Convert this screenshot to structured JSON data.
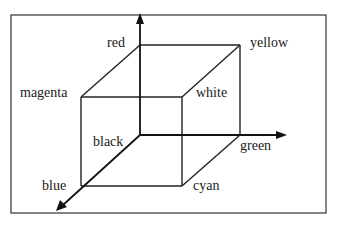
{
  "diagram": {
    "type": "3d-axes-cube",
    "frame": {
      "x": 11,
      "y": 15,
      "width": 315,
      "height": 198,
      "stroke": "#333333"
    },
    "origin": {
      "x": 140,
      "y": 135
    },
    "axes": [
      {
        "id": "red-axis",
        "direction": "up",
        "from": [
          140,
          135
        ],
        "to": [
          140,
          14
        ]
      },
      {
        "id": "green-axis",
        "direction": "right",
        "from": [
          140,
          135
        ],
        "to": [
          286,
          135
        ]
      },
      {
        "id": "blue-axis",
        "direction": "down-left",
        "from": [
          140,
          135
        ],
        "to": [
          57,
          210
        ]
      }
    ],
    "vertices": {
      "black": {
        "x": 140,
        "y": 135
      },
      "red": {
        "x": 140,
        "y": 45
      },
      "yellow": {
        "x": 240,
        "y": 45
      },
      "green": {
        "x": 240,
        "y": 135
      },
      "magenta": {
        "x": 81,
        "y": 97
      },
      "white": {
        "x": 182,
        "y": 97
      },
      "blue": {
        "x": 81,
        "y": 186
      },
      "cyan": {
        "x": 182,
        "y": 186
      }
    },
    "labels": [
      {
        "id": "red",
        "text": "red",
        "x": 107,
        "y": 47
      },
      {
        "id": "yellow",
        "text": "yellow",
        "x": 250,
        "y": 47
      },
      {
        "id": "magenta",
        "text": "magenta",
        "x": 20,
        "y": 97
      },
      {
        "id": "white",
        "text": "white",
        "x": 196,
        "y": 97
      },
      {
        "id": "black",
        "text": "black",
        "x": 93,
        "y": 146
      },
      {
        "id": "green",
        "text": "green",
        "x": 240,
        "y": 150
      },
      {
        "id": "blue",
        "text": "blue",
        "x": 42,
        "y": 190
      },
      {
        "id": "cyan",
        "text": "cyan",
        "x": 193,
        "y": 190
      }
    ]
  }
}
